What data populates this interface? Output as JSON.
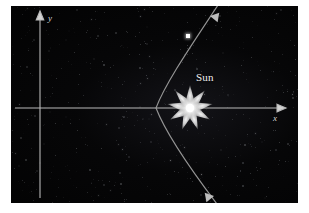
{
  "figure": {
    "background_color": "#ffffff",
    "panel_color": "#060607"
  },
  "labels": {
    "x_axis": "x",
    "y_axis": "y",
    "sun": "Sun"
  },
  "colors": {
    "axis": "#b9b9b9",
    "orbit": "#9a9a9a",
    "sun_core": "#ffffff",
    "sun_glow": "#f0f0f0",
    "comet": "#ffffff",
    "sky": "#060607",
    "page": "#ffffff"
  },
  "chart_data": {
    "type": "line",
    "xlabel": "x",
    "ylabel": "y",
    "grid": false,
    "legend": false,
    "annotations": [
      {
        "name": "sun",
        "text": "Sun",
        "x": 190,
        "y": 108,
        "marker": "star-9-point"
      },
      {
        "name": "comet",
        "text": "",
        "x": 189,
        "y": 38,
        "marker": "square"
      },
      {
        "name": "inbound-arrow",
        "text": "",
        "x": 219,
        "y": 10,
        "marker": "arrow-down-left"
      },
      {
        "name": "outbound-arrow",
        "text": "",
        "x": 212,
        "y": 200,
        "marker": "arrow-down-right"
      }
    ],
    "axes": {
      "origin": {
        "x": 40,
        "y": 108
      },
      "x_axis": {
        "from": [
          14,
          108
        ],
        "to": [
          278,
          108
        ],
        "arrow": "right"
      },
      "y_axis": {
        "from": [
          40,
          198
        ],
        "to": [
          40,
          14
        ],
        "arrow": "up"
      }
    },
    "series": [
      {
        "name": "comet-orbit",
        "shape": "parabola opening right-ward, focus at Sun",
        "vertex": {
          "x": 156,
          "y": 108
        },
        "points": [
          [
            219,
            6
          ],
          [
            207,
            23
          ],
          [
            195,
            40
          ],
          [
            185,
            56
          ],
          [
            175,
            73
          ],
          [
            167,
            88
          ],
          [
            160,
            100
          ],
          [
            156,
            108
          ],
          [
            159,
            120
          ],
          [
            165,
            134
          ],
          [
            173,
            150
          ],
          [
            182,
            165
          ],
          [
            193,
            181
          ],
          [
            206,
            199
          ]
        ]
      }
    ]
  }
}
